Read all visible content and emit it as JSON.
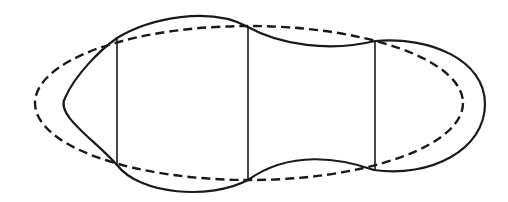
{
  "diagram": {
    "title": "",
    "colors": {
      "stroke": "#1a1a1a",
      "background": "#ffffff"
    },
    "dashed_ellipse": {
      "cx": 249,
      "cy": 103,
      "rx": 214,
      "ry": 77
    },
    "vertical_lines": [
      {
        "id": "left",
        "x": 117,
        "y1": 38,
        "y2": 165
      },
      {
        "id": "middle",
        "x": 248,
        "y1": 27,
        "y2": 180
      },
      {
        "id": "right",
        "x": 375,
        "y1": 41,
        "y2": 170
      }
    ],
    "solid_outline_path": "M 117 38 C 150 18, 210 6, 248 27 C 280 45, 330 52, 375 41 C 430 36, 485 60, 485 104 C 485 150, 430 178, 374 170 C 340 158, 290 150, 248 180 C 210 200, 140 195, 117 165 C 95 140, 55 115, 65 98 C 75 75, 100 50, 117 38 Z"
  }
}
